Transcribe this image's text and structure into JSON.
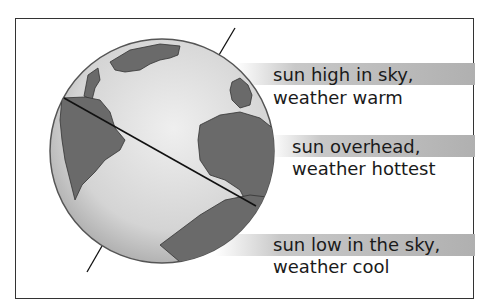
{
  "diagram": {
    "labels": [
      {
        "line1": "sun high in sky,",
        "line2": "weather warm"
      },
      {
        "line1": "sun overhead,",
        "line2": "weather hottest"
      },
      {
        "line1": "sun low in the sky,",
        "line2": "weather cool"
      }
    ],
    "colors": {
      "border": "#333333",
      "band": "#b8b8b8",
      "ocean": "#dcdcdc",
      "land": "#6e6e6e",
      "axis": "#111111"
    }
  }
}
